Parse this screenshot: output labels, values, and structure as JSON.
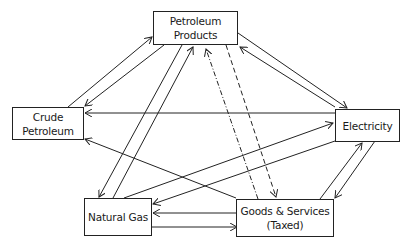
{
  "diagram": {
    "type": "flow-network",
    "nodes": {
      "petroleum_products": {
        "line1": "Petroleum",
        "line2": "Products"
      },
      "crude_petroleum": {
        "line1": "Crude",
        "line2": "Petroleum"
      },
      "electricity": {
        "line1": "Electricity"
      },
      "natural_gas": {
        "line1": "Natural Gas"
      },
      "goods_services": {
        "line1": "Goods & Services",
        "line2": "(Taxed)"
      }
    },
    "edges": [
      {
        "from": "Crude Petroleum",
        "to": "Petroleum Products",
        "style": "solid"
      },
      {
        "from": "Petroleum Products",
        "to": "Crude Petroleum",
        "style": "solid"
      },
      {
        "from": "Petroleum Products",
        "to": "Natural Gas",
        "style": "solid"
      },
      {
        "from": "Natural Gas",
        "to": "Petroleum Products",
        "style": "solid"
      },
      {
        "from": "Goods & Services (Taxed)",
        "to": "Petroleum Products",
        "style": "dash-dot"
      },
      {
        "from": "Petroleum Products",
        "to": "Goods & Services (Taxed)",
        "style": "dashed"
      },
      {
        "from": "Petroleum Products",
        "to": "Electricity",
        "style": "solid"
      },
      {
        "from": "Electricity",
        "to": "Petroleum Products",
        "style": "solid"
      },
      {
        "from": "Electricity",
        "to": "Crude Petroleum",
        "style": "solid"
      },
      {
        "from": "Goods & Services (Taxed)",
        "to": "Crude Petroleum",
        "style": "solid"
      },
      {
        "from": "Natural Gas",
        "to": "Electricity",
        "style": "solid"
      },
      {
        "from": "Electricity",
        "to": "Natural Gas",
        "style": "solid"
      },
      {
        "from": "Goods & Services (Taxed)",
        "to": "Electricity",
        "style": "solid"
      },
      {
        "from": "Electricity",
        "to": "Goods & Services (Taxed)",
        "style": "solid"
      },
      {
        "from": "Goods & Services (Taxed)",
        "to": "Natural Gas",
        "style": "solid"
      },
      {
        "from": "Natural Gas",
        "to": "Goods & Services (Taxed)",
        "style": "solid"
      }
    ]
  },
  "colors": {
    "line": "#222222",
    "text": "#1a1a1a",
    "background": "#ffffff"
  }
}
